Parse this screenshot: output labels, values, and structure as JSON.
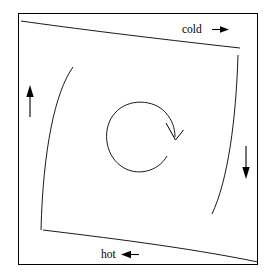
{
  "figure": {
    "background_color": "#ffffff",
    "line_color": "#000000",
    "frame": {
      "name": "outer-frame",
      "x": 18,
      "y": 13,
      "width": 240,
      "height": 252
    },
    "labels": {
      "cold": {
        "text": "cold",
        "arrow_glyph": "→",
        "arrow_direction": "right",
        "x": 182,
        "y": 33
      },
      "hot": {
        "text": "hot",
        "arrow_glyph": "←",
        "arrow_direction": "left",
        "x": 101,
        "y": 258
      }
    },
    "side_arrows": [
      {
        "name": "left-up-arrow",
        "direction": "up",
        "x": 30,
        "y_top": 86,
        "y_bottom": 117
      },
      {
        "name": "right-down-arrow",
        "direction": "down",
        "x": 246,
        "y_top": 146,
        "y_bottom": 178
      }
    ],
    "rotation": {
      "name": "circulation-arrow",
      "direction": "clockwise",
      "center_x": 142,
      "center_y": 140,
      "radius": 32
    },
    "boundary_curves": [
      {
        "name": "top-cold-boundary",
        "from": "upper-left",
        "to": "upper-right"
      },
      {
        "name": "bottom-hot-boundary",
        "from": "lower-left",
        "to": "lower-right"
      },
      {
        "name": "left-boundary",
        "from": "upper-inner",
        "to": "lower-left"
      },
      {
        "name": "right-boundary",
        "from": "upper-right",
        "to": "lower-inner"
      }
    ]
  }
}
